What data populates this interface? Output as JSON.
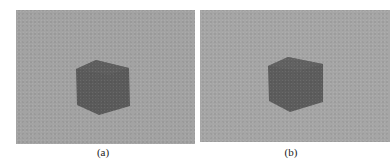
{
  "figure": {
    "panels": [
      {
        "id": "a",
        "caption": "(a)",
        "content": "gray cube on textured gray background",
        "background": "#a3a3a3",
        "cube_color": "#5a5a5a"
      },
      {
        "id": "b",
        "caption": "(b)",
        "content": "gray cube on gray background, slightly different viewpoint",
        "background": "#a6a6a6",
        "cube_color": "#5e5e5e"
      }
    ]
  }
}
